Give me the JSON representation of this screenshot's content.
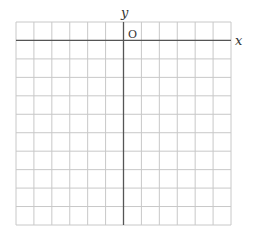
{
  "diagram": {
    "type": "coordinate-grid",
    "labels": {
      "x_axis": "x",
      "y_axis": "y",
      "origin": "O"
    },
    "grid": {
      "columns": 12,
      "rows": 11,
      "columns_left_of_y_axis": 6,
      "rows_above_x_axis": 1
    },
    "colors": {
      "grid_line": "#c8c8c8",
      "axis_line": "#555555",
      "label": "#333333"
    }
  }
}
